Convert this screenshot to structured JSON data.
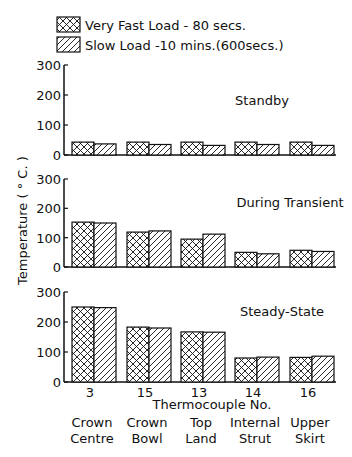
{
  "legend": {
    "items": [
      {
        "label": "Very Fast Load  - 80 secs.",
        "pattern": "crosshatch"
      },
      {
        "label": "Slow Load  -10 mins.(600secs.)",
        "pattern": "diagonal-hatch"
      }
    ]
  },
  "axis": {
    "ylabel": "Temperature   ( ° C. )",
    "xlabel": "Thermocouple  No.",
    "yticks": [
      "0",
      "100",
      "200",
      "300"
    ]
  },
  "categories": [
    {
      "tc": "3",
      "name1": "Crown",
      "name2": "Centre"
    },
    {
      "tc": "15",
      "name1": "Crown",
      "name2": "Bowl"
    },
    {
      "tc": "13",
      "name1": "Top",
      "name2": "Land"
    },
    {
      "tc": "14",
      "name1": "Internal",
      "name2": "Strut"
    },
    {
      "tc": "16",
      "name1": "Upper",
      "name2": "Skirt"
    }
  ],
  "panels": [
    {
      "title": "Standby"
    },
    {
      "title": "During Transient"
    },
    {
      "title": "Steady-State"
    }
  ],
  "chart_data": [
    {
      "type": "bar",
      "title": "Standby",
      "categories": [
        "3 Crown Centre",
        "15 Crown Bowl",
        "13 Top Land",
        "14 Internal Strut",
        "16 Upper Skirt"
      ],
      "series": [
        {
          "name": "Very Fast Load - 80 secs.",
          "values": [
            43,
            43,
            43,
            43,
            43
          ]
        },
        {
          "name": "Slow Load - 10 mins. (600 secs.)",
          "values": [
            37,
            35,
            32,
            35,
            32
          ]
        }
      ],
      "xlabel": "Thermocouple No.",
      "ylabel": "Temperature (°C)",
      "ylim": [
        0,
        300
      ],
      "legend_position": "top"
    },
    {
      "type": "bar",
      "title": "During Transient",
      "categories": [
        "3 Crown Centre",
        "15 Crown Bowl",
        "13 Top Land",
        "14 Internal Strut",
        "16 Upper Skirt"
      ],
      "series": [
        {
          "name": "Very Fast Load - 80 secs.",
          "values": [
            153,
            119,
            95,
            50,
            57
          ]
        },
        {
          "name": "Slow Load - 10 mins. (600 secs.)",
          "values": [
            150,
            123,
            112,
            45,
            53
          ]
        }
      ],
      "xlabel": "Thermocouple No.",
      "ylabel": "Temperature (°C)",
      "ylim": [
        0,
        300
      ]
    },
    {
      "type": "bar",
      "title": "Steady-State",
      "categories": [
        "3 Crown Centre",
        "15 Crown Bowl",
        "13 Top Land",
        "14 Internal Strut",
        "16 Upper Skirt"
      ],
      "series": [
        {
          "name": "Very Fast Load - 80 secs.",
          "values": [
            250,
            183,
            167,
            80,
            82
          ]
        },
        {
          "name": "Slow Load - 10 mins. (600 secs.)",
          "values": [
            248,
            180,
            166,
            83,
            86
          ]
        }
      ],
      "xlabel": "Thermocouple No.",
      "ylabel": "Temperature (°C)",
      "ylim": [
        0,
        300
      ]
    }
  ]
}
